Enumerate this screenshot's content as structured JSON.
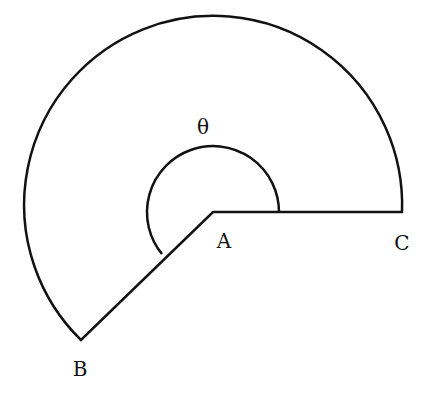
{
  "diagram": {
    "type": "circular sector with angle marker",
    "labels": {
      "vertex": "A",
      "point_b": "B",
      "point_c": "C",
      "angle": "θ"
    },
    "geometry": {
      "center": [
        213,
        212
      ],
      "outer_radius": 189,
      "angle_arc_radius": 66,
      "ray_c_end": [
        402,
        212
      ],
      "ray_b_end": [
        81,
        340
      ]
    },
    "colors": {
      "stroke": "#111111",
      "background": "#ffffff"
    }
  }
}
